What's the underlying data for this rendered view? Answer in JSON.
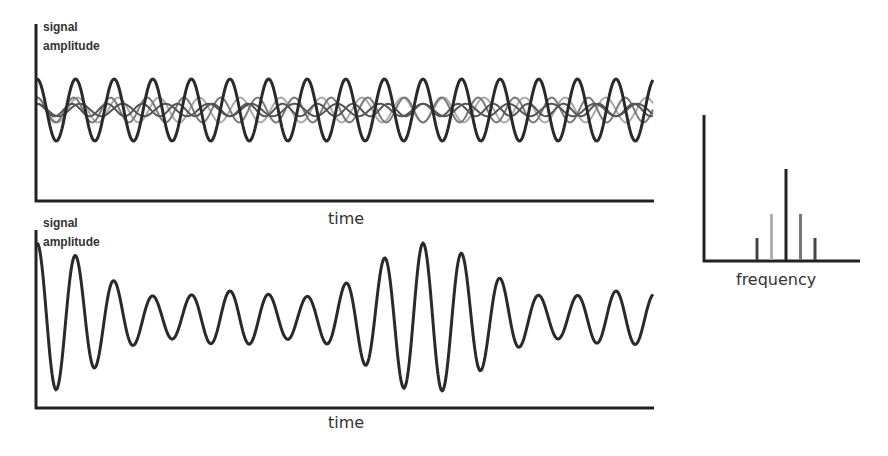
{
  "panels": {
    "top": {
      "y_label_line1": "signal",
      "y_label_line2": "amplitude",
      "x_label": "time"
    },
    "bottom": {
      "y_label_line1": "signal",
      "y_label_line2": "amplitude",
      "x_label": "time"
    },
    "spectrum": {
      "x_label": "frequency"
    }
  },
  "colors": {
    "axis": "#222222",
    "carrier": "#2a2a2a",
    "sideband_dark": "#555555",
    "sideband_mid": "#7a7a7a",
    "sideband_light": "#aaaaaa"
  },
  "chart_data": [
    {
      "type": "line",
      "title": "Component sinusoids (time domain)",
      "xlabel": "time",
      "ylabel": "signal amplitude",
      "series": [
        {
          "name": "carrier",
          "relative_frequency": 1.0,
          "relative_amplitude": 1.0,
          "color": "#2a2a2a"
        },
        {
          "name": "lower sideband 1",
          "relative_frequency": 0.95,
          "relative_amplitude": 0.4,
          "color": "#aaaaaa"
        },
        {
          "name": "upper sideband 1",
          "relative_frequency": 1.05,
          "relative_amplitude": 0.4,
          "color": "#7a7a7a"
        },
        {
          "name": "lower sideband 2",
          "relative_frequency": 0.9,
          "relative_amplitude": 0.2,
          "color": "#555555"
        },
        {
          "name": "upper sideband 2",
          "relative_frequency": 1.1,
          "relative_amplitude": 0.2,
          "color": "#555555"
        }
      ]
    },
    {
      "type": "line",
      "title": "Sum signal (beats / wave packets)",
      "xlabel": "time",
      "ylabel": "signal amplitude",
      "envelope_peaks_x": [
        0,
        0.63
      ],
      "description": "amplitude-modulated sum of the five components showing two wave packets"
    },
    {
      "type": "bar",
      "title": "Spectrum",
      "xlabel": "frequency",
      "categories": [
        "f0-2Δ",
        "f0-Δ",
        "f0",
        "f0+Δ",
        "f0+2Δ"
      ],
      "values": [
        0.2,
        0.4,
        1.0,
        0.4,
        0.2
      ],
      "bar_colors": [
        "#444444",
        "#b0b0b0",
        "#222222",
        "#777777",
        "#444444"
      ]
    }
  ]
}
